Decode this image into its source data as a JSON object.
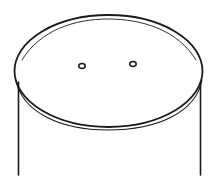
{
  "figure": {
    "colors": {
      "stroke": "#1a1a1a",
      "background": "#ffffff"
    },
    "cylinder": {
      "left_side_x": 19,
      "right_side_x": 200,
      "bottom_y": 175
    },
    "lid": {
      "cx": 108,
      "cy": 71,
      "rx": 94,
      "ry": 56
    },
    "holes": [
      {
        "cx": 82,
        "cy": 66
      },
      {
        "cx": 133,
        "cy": 64
      }
    ]
  }
}
